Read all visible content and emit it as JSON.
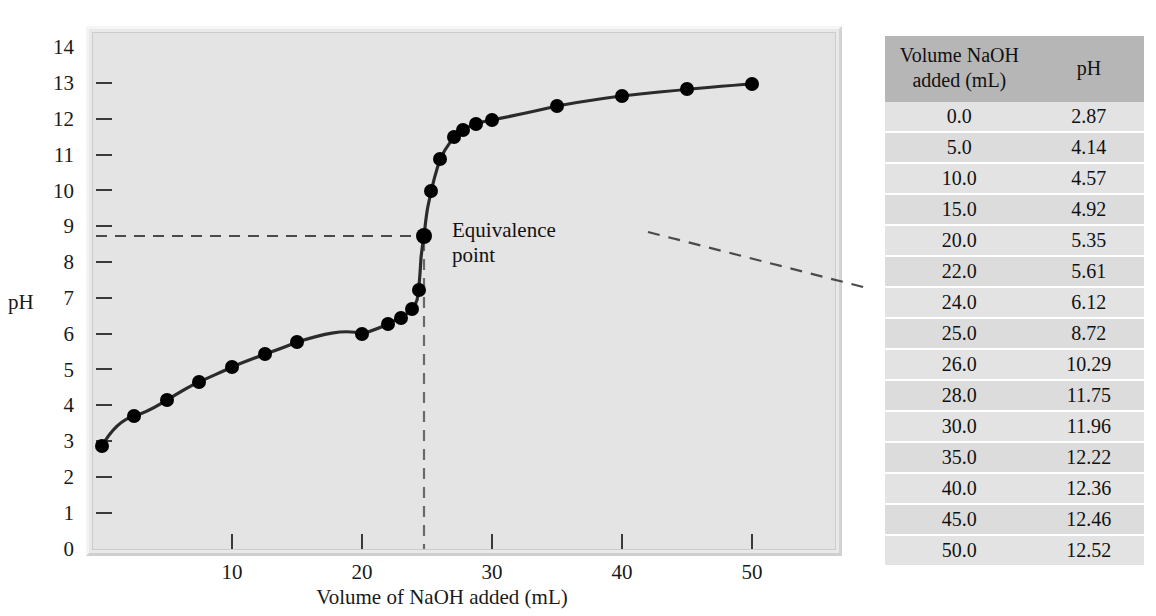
{
  "chart_data": {
    "type": "line",
    "title": "",
    "xlabel": "Volume of NaOH added (mL)",
    "ylabel": "pH",
    "xlim": [
      0,
      53
    ],
    "ylim": [
      0,
      14
    ],
    "xticks": [
      10,
      20,
      30,
      40,
      50
    ],
    "yticks": [
      0,
      1,
      2,
      3,
      4,
      5,
      6,
      7,
      8,
      9,
      10,
      11,
      12,
      13,
      14
    ],
    "grid": false,
    "legend": null,
    "x": [
      0.0,
      2.5,
      5.0,
      7.5,
      10.0,
      12.5,
      15.0,
      20.0,
      22.0,
      23.0,
      24.0,
      24.5,
      25.0,
      25.5,
      26.0,
      27.0,
      28.0,
      29.0,
      30.0,
      35.0,
      40.0,
      45.0,
      50.0
    ],
    "y": [
      2.87,
      3.7,
      4.14,
      4.33,
      4.57,
      4.7,
      4.92,
      5.35,
      5.61,
      5.8,
      6.12,
      6.3,
      8.72,
      10.35,
      11.6,
      11.85,
      11.75,
      12.05,
      11.96,
      12.22,
      12.36,
      12.46,
      12.52
    ],
    "markers": true,
    "annotations": [
      {
        "label": "Equivalence point",
        "x": 25.0,
        "y": 8.72
      }
    ],
    "guide_lines": [
      {
        "orientation": "horizontal",
        "value": 8.72,
        "style": "dashed"
      },
      {
        "orientation": "vertical",
        "value": 25.0,
        "style": "dashed"
      }
    ]
  },
  "axes": {
    "y_title": "pH",
    "x_title": "Volume of NaOH added (mL)",
    "y_labels": [
      "14",
      "13",
      "12",
      "11",
      "10",
      "9",
      "8",
      "7",
      "6",
      "5",
      "4",
      "3",
      "2",
      "1",
      "0"
    ],
    "x_labels": [
      "10",
      "20",
      "30",
      "40",
      "50"
    ]
  },
  "annotation": {
    "line1": "Equivalence",
    "line2": "point"
  },
  "table": {
    "headers": {
      "volume_line1": "Volume NaOH",
      "volume_line2": "added (mL)",
      "ph": "pH"
    },
    "rows": [
      {
        "volume": "0.0",
        "ph": "2.87"
      },
      {
        "volume": "5.0",
        "ph": "4.14"
      },
      {
        "volume": "10.0",
        "ph": "4.57"
      },
      {
        "volume": "15.0",
        "ph": "4.92"
      },
      {
        "volume": "20.0",
        "ph": "5.35"
      },
      {
        "volume": "22.0",
        "ph": "5.61"
      },
      {
        "volume": "24.0",
        "ph": "6.12"
      },
      {
        "volume": "25.0",
        "ph": "8.72"
      },
      {
        "volume": "26.0",
        "ph": "10.29"
      },
      {
        "volume": "28.0",
        "ph": "11.75"
      },
      {
        "volume": "30.0",
        "ph": "11.96"
      },
      {
        "volume": "35.0",
        "ph": "12.22"
      },
      {
        "volume": "40.0",
        "ph": "12.36"
      },
      {
        "volume": "45.0",
        "ph": "12.46"
      },
      {
        "volume": "50.0",
        "ph": "12.52"
      }
    ]
  },
  "colors": {
    "plot_background": "#e4e4e4",
    "curve": "#1a1a1a",
    "marker": "#000000",
    "table_header_bg": "#b6b6b6",
    "table_row_odd": "#e3e3e3",
    "table_row_even": "#dcdcdc",
    "page_background": "#ffffff"
  }
}
